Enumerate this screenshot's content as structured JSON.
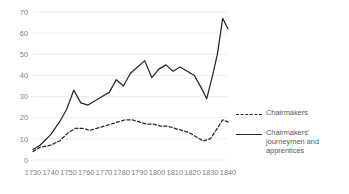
{
  "chart_data": {
    "type": "line",
    "title": "",
    "subtitle": "",
    "xlabel": "",
    "ylabel": "",
    "xlim": [
      1730,
      1840
    ],
    "ylim": [
      0,
      70
    ],
    "grid": true,
    "legend_position": "right",
    "y_ticks": [
      0,
      10,
      20,
      30,
      40,
      50,
      60,
      70
    ],
    "x_ticks": [
      1730,
      1740,
      1750,
      1760,
      1770,
      1780,
      1790,
      1800,
      1810,
      1820,
      1830,
      1840
    ],
    "series": [
      {
        "name": "Chairmakers",
        "style": "dashed",
        "color": "#262626",
        "x": [
          1730,
          1734,
          1740,
          1745,
          1750,
          1754,
          1758,
          1762,
          1766,
          1770,
          1774,
          1778,
          1782,
          1786,
          1790,
          1794,
          1798,
          1802,
          1806,
          1810,
          1814,
          1818,
          1822,
          1826,
          1830,
          1834,
          1837,
          1840
        ],
        "values": [
          4,
          6,
          7,
          9,
          13,
          15,
          15,
          14,
          15,
          16,
          17,
          18,
          19,
          19,
          18,
          17,
          17,
          16,
          16,
          15,
          14,
          13,
          11,
          9,
          10,
          15,
          19,
          18
        ]
      },
      {
        "name": "Chairmakers' journeymen and apprentices",
        "style": "solid",
        "color": "#262626",
        "x": [
          1730,
          1734,
          1740,
          1745,
          1749,
          1753,
          1757,
          1761,
          1765,
          1769,
          1773,
          1777,
          1781,
          1785,
          1789,
          1793,
          1797,
          1801,
          1805,
          1809,
          1813,
          1817,
          1821,
          1825,
          1828,
          1831,
          1834,
          1837,
          1840
        ],
        "values": [
          5,
          7,
          12,
          18,
          24,
          33,
          27,
          26,
          28,
          30,
          32,
          38,
          35,
          41,
          44,
          47,
          39,
          43,
          45,
          42,
          44,
          42,
          40,
          34,
          29,
          39,
          50,
          67,
          62
        ]
      }
    ]
  },
  "legend": {
    "items": [
      {
        "label": "Chairmakers",
        "style": "dashed"
      },
      {
        "label": "Chairmakers' journeymen and apprentices",
        "style": "solid"
      }
    ]
  }
}
